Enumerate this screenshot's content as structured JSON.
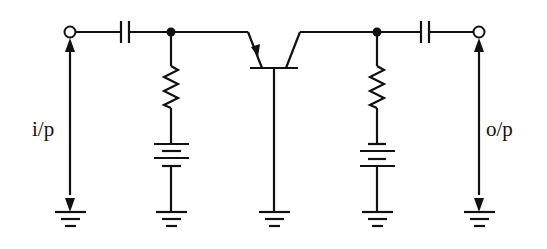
{
  "diagram": {
    "labels": {
      "input": "i/p",
      "output": "o/p"
    },
    "components": [
      {
        "id": "input-terminal",
        "type": "terminal"
      },
      {
        "id": "input-coupling-capacitor",
        "type": "capacitor"
      },
      {
        "id": "emitter-resistor",
        "type": "resistor"
      },
      {
        "id": "emitter-bias-battery",
        "type": "battery"
      },
      {
        "id": "transistor",
        "type": "pnp-bjt",
        "configuration": "common-base"
      },
      {
        "id": "collector-resistor",
        "type": "resistor"
      },
      {
        "id": "collector-bias-battery",
        "type": "battery"
      },
      {
        "id": "output-coupling-capacitor",
        "type": "capacitor"
      },
      {
        "id": "output-terminal",
        "type": "terminal"
      },
      {
        "id": "grounds",
        "type": "ground",
        "count": 5
      }
    ],
    "colors": {
      "line": "#111111",
      "background": "#ffffff"
    }
  }
}
